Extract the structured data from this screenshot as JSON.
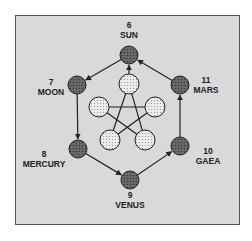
{
  "diagram": {
    "outer_nodes": [
      {
        "id": "sun",
        "number": "6",
        "name": "SUN",
        "cx": 129,
        "cy": 55
      },
      {
        "id": "moon",
        "number": "7",
        "name": "MOON",
        "cx": 77,
        "cy": 85
      },
      {
        "id": "mercury",
        "number": "8",
        "name": "MERCURY",
        "cx": 78,
        "cy": 149
      },
      {
        "id": "venus",
        "number": "9",
        "name": "VENUS",
        "cx": 130,
        "cy": 180
      },
      {
        "id": "gaea",
        "number": "10",
        "name": "GAEA",
        "cx": 180,
        "cy": 146
      },
      {
        "id": "mars",
        "number": "11",
        "name": "MARS",
        "cx": 180,
        "cy": 85
      }
    ],
    "outer_edges": [
      {
        "from": "sun",
        "to": "moon"
      },
      {
        "from": "moon",
        "to": "mercury"
      },
      {
        "from": "mercury",
        "to": "venus"
      },
      {
        "from": "venus",
        "to": "gaea"
      },
      {
        "from": "gaea",
        "to": "mars"
      },
      {
        "from": "mars",
        "to": "sun"
      }
    ],
    "inner_nodes": [
      {
        "id": "inner-top",
        "cx": 129,
        "cy": 84
      },
      {
        "id": "inner-left",
        "cx": 99,
        "cy": 107
      },
      {
        "id": "inner-right",
        "cx": 155,
        "cy": 107
      },
      {
        "id": "inner-bottom-left",
        "cx": 110,
        "cy": 140
      },
      {
        "id": "inner-bottom-right",
        "cx": 145,
        "cy": 140
      }
    ],
    "pentagram_edges": [
      {
        "from": "inner-top",
        "to": "inner-bottom-left"
      },
      {
        "from": "inner-top",
        "to": "inner-bottom-right"
      },
      {
        "from": "inner-left",
        "to": "inner-right"
      },
      {
        "from": "inner-left",
        "to": "inner-bottom-right"
      },
      {
        "from": "inner-right",
        "to": "inner-bottom-left"
      }
    ],
    "center_arrow": {
      "from": "inner-top",
      "to": "sun"
    },
    "colors": {
      "background": "#d9d9d9",
      "outer_node_fill": "#5a5a5a",
      "inner_node_fill": "#e6e6e6",
      "stroke": "#222222"
    }
  },
  "labels": {
    "sun": {
      "number": "6",
      "name": "SUN"
    },
    "moon": {
      "number": "7",
      "name": "MOON"
    },
    "mercury": {
      "number": "8",
      "name": "MERCURY"
    },
    "venus": {
      "number": "9",
      "name": "VENUS"
    },
    "gaea": {
      "number": "10",
      "name": "GAEA"
    },
    "mars": {
      "number": "11",
      "name": "MARS"
    }
  }
}
